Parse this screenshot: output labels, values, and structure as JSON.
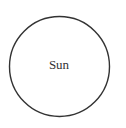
{
  "diagram": {
    "type": "single-node",
    "nodes": [
      {
        "id": "sun",
        "label": "Sun",
        "shape": "circle",
        "center": [
          59,
          66
        ],
        "radius": 50,
        "stroke_color": "#333333",
        "fill_color": "#ffffff"
      }
    ]
  }
}
